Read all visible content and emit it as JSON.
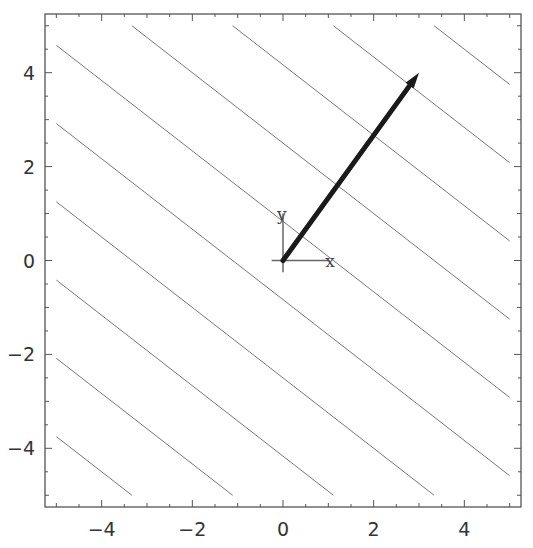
{
  "chart_data": {
    "type": "line",
    "title": "",
    "xlabel": "",
    "ylabel": "",
    "xlim": [
      -5.25,
      5.25
    ],
    "ylim": [
      -5.25,
      5.25
    ],
    "grid": false,
    "legend": null,
    "x_ticks": [
      -4,
      -2,
      0,
      2,
      4
    ],
    "y_ticks": [
      -4,
      -2,
      0,
      2,
      4
    ],
    "x_tick_labels": [
      "-4",
      "-2",
      "0",
      "2",
      "4"
    ],
    "y_tick_labels": [
      "-4",
      "-2",
      "0",
      "2",
      "4"
    ],
    "function": "3x + 4y",
    "contour_levels": [
      -30,
      -23.333,
      -16.667,
      -10,
      -3.333,
      3.333,
      10,
      16.667,
      23.333,
      30
    ],
    "contour_domain": [
      [
        -5,
        5
      ],
      [
        -5,
        5
      ]
    ],
    "vector": {
      "from": [
        0,
        0
      ],
      "to": [
        3,
        4
      ]
    },
    "origin_axes": {
      "x_label": "x",
      "y_label": "y",
      "length": 1
    }
  },
  "colors": {
    "contour": "#777777",
    "vector": "#1a1a1a",
    "frame": "#555555"
  }
}
